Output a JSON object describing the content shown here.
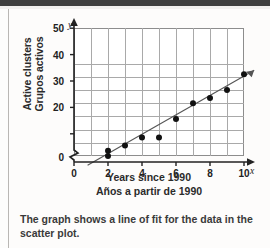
{
  "caption": "The graph shows a line of fit for the data in the scatter plot.",
  "axis": {
    "y_title_en": "Active clusters",
    "y_title_es": "Grupos activos",
    "x_title_en": "Years since 1990",
    "x_title_es": "Años a partir de 1990",
    "x_var": "x",
    "y_var": "y"
  },
  "chart_data": {
    "type": "scatter",
    "title": "",
    "xlabel": "Years since 1990",
    "ylabel": "Active clusters",
    "xlim": [
      0,
      11
    ],
    "ylim": [
      0,
      55
    ],
    "y_axis_break": true,
    "y_break_between": [
      0,
      20
    ],
    "grid": true,
    "legend": false,
    "xticks": [
      "0",
      "2",
      "4",
      "6",
      "8",
      "10"
    ],
    "xtick_values": [
      0,
      2,
      4,
      6,
      8,
      10
    ],
    "yticks": [
      "0",
      "20",
      "30",
      "40",
      "50"
    ],
    "ytick_values": [
      0,
      20,
      30,
      40,
      50
    ],
    "points": [
      {
        "x": 2,
        "y": 22
      },
      {
        "x": 2,
        "y": 20
      },
      {
        "x": 3,
        "y": 24
      },
      {
        "x": 4,
        "y": 27
      },
      {
        "x": 5,
        "y": 27
      },
      {
        "x": 6,
        "y": 34
      },
      {
        "x": 7,
        "y": 40
      },
      {
        "x": 8,
        "y": 42
      },
      {
        "x": 9,
        "y": 45
      },
      {
        "x": 10,
        "y": 51
      }
    ],
    "series": [
      {
        "name": "line of fit",
        "type": "line",
        "x": [
          0.8,
          10.6
        ],
        "y": [
          16.5,
          52.5
        ]
      }
    ],
    "colors": {
      "dot": "#111111",
      "fit_line": "#555555",
      "grid": "#a9a9a9",
      "axis": "#222222"
    }
  }
}
